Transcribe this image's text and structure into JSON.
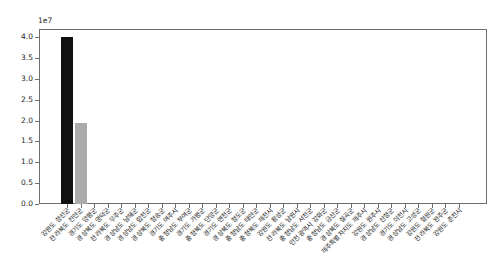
{
  "figure": {
    "background": "#ffffff",
    "spine_color": "#6e6e6e",
    "tick_label_color": "#262626"
  },
  "chart_data": {
    "type": "bar",
    "offset_text": "1e7",
    "title": "",
    "xlabel": "",
    "ylabel": "",
    "grid": false,
    "legend": null,
    "ylim": [
      0,
      42000000
    ],
    "yticks": [
      "0.0",
      "0.5",
      "1.0",
      "1.5",
      "2.0",
      "2.5",
      "3.0",
      "3.5",
      "4.0"
    ],
    "ytick_values": [
      0,
      5000000,
      10000000,
      15000000,
      20000000,
      25000000,
      30000000,
      35000000,
      40000000
    ],
    "categories": [
      "강원도 정선군",
      "전라북도 진안군",
      "경기도 양평군",
      "경상북도 영덕군",
      "전라북도 무주군",
      "경상남도 남해군",
      "경상남도 합천군",
      "경상북도 청송군",
      "경기도 여주시",
      "충청남도 부여군",
      "경기도 가평군",
      "충청북도 단양군",
      "경기도 연천군",
      "경상북도 청도군",
      "충청남도 태안군",
      "충청북도 제천시",
      "강원도 횡성군",
      "전라북도 남원시",
      "충청남도 서천군",
      "인천광역시 강화군",
      "충청남도 금산군",
      "경상북도 칠곡군",
      "제주특별자치도 제주시",
      "강원도 원주시",
      "경상남도 산청군",
      "경기도 이천시",
      "경상남도 고성군",
      "강원도 철원군",
      "전라북도 완주군",
      "강원도 춘천시"
    ],
    "values": [
      40000000,
      19500000,
      0,
      0,
      0,
      0,
      0,
      0,
      0,
      0,
      0,
      0,
      0,
      0,
      0,
      0,
      0,
      0,
      0,
      0,
      0,
      0,
      0,
      0,
      0,
      0,
      0,
      0,
      0,
      0
    ],
    "bar_colors": [
      "#111111",
      "#ababab",
      "",
      "",
      "",
      "",
      "",
      "",
      "",
      "",
      "",
      "",
      "",
      "",
      "",
      "",
      "",
      "",
      "",
      "",
      "",
      "",
      "",
      "",
      "",
      "",
      "",
      "",
      "",
      ""
    ]
  }
}
